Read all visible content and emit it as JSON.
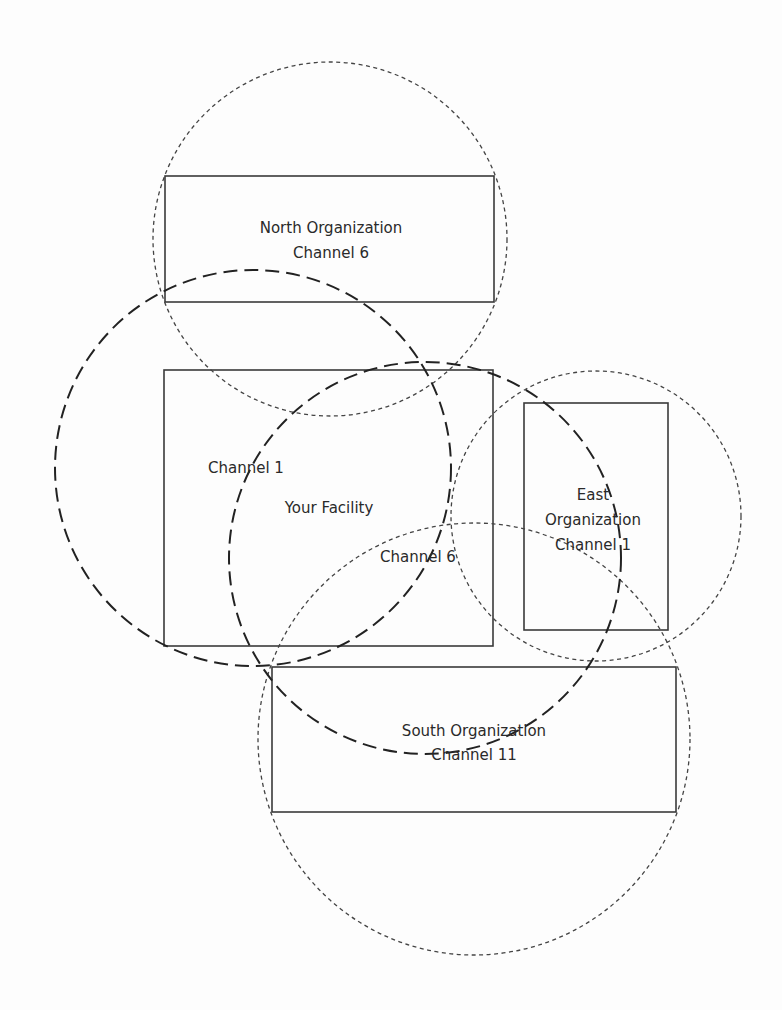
{
  "diagram": {
    "colors": {
      "background": "#fdfdfd",
      "stroke": "#3a3a3a",
      "text": "#2a2a2a"
    },
    "regions": {
      "north": {
        "name": "North Organization",
        "channel": "Channel 6",
        "box": {
          "x": 165,
          "y": 176,
          "w": 329,
          "h": 126
        },
        "coverage": {
          "cx": 330,
          "cy": 239,
          "r": 177,
          "style": "dotted"
        }
      },
      "facility": {
        "name": "Your Facility",
        "box": {
          "x": 164,
          "y": 370,
          "w": 329,
          "h": 276
        },
        "coverage_channel1": {
          "label": "Channel 1",
          "cx": 253,
          "cy": 468,
          "r": 198,
          "style": "dashed"
        },
        "coverage_channel6": {
          "label": "Channel 6",
          "cx": 425,
          "cy": 558,
          "r": 196,
          "style": "dashed"
        }
      },
      "east": {
        "name_line1": "East",
        "name_line2": "Organization",
        "channel": "Channel 1",
        "box": {
          "x": 524,
          "y": 403,
          "w": 144,
          "h": 227
        },
        "coverage": {
          "cx": 596,
          "cy": 516,
          "r": 145,
          "style": "dotted"
        }
      },
      "south": {
        "name": "South Organization",
        "channel": "Channel 11",
        "box": {
          "x": 272,
          "y": 667,
          "w": 404,
          "h": 145
        },
        "coverage": {
          "cx": 474,
          "cy": 739,
          "r": 216,
          "style": "dotted"
        }
      }
    }
  }
}
